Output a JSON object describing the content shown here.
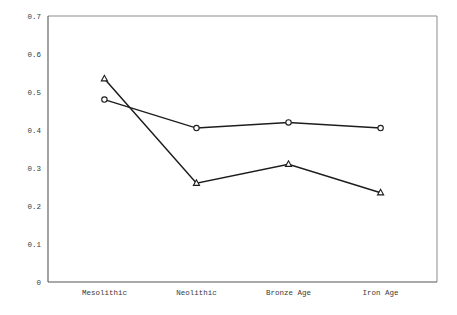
{
  "chart_data": {
    "type": "line",
    "title": "",
    "subtitle": "",
    "xlabel": "",
    "ylabel": "",
    "categories": [
      "Mesolithic",
      "Neolithic",
      "Bronze Age",
      "Iron Age"
    ],
    "yticks": [
      "0",
      "0.1",
      "0.2",
      "0.3",
      "0.4",
      "0.5",
      "0.6",
      "0.7"
    ],
    "ytick_values": [
      0,
      0.1,
      0.2,
      0.3,
      0.4,
      0.5,
      0.6,
      0.7
    ],
    "ylim": [
      0,
      0.7
    ],
    "grid": false,
    "legend_position": "none",
    "series": [
      {
        "name": "Series 1",
        "marker": "circle",
        "color": "#1d1d1d",
        "values": [
          0.48,
          0.405,
          0.42,
          0.405
        ]
      },
      {
        "name": "Series 2",
        "marker": "triangle",
        "color": "#1d1d1d",
        "values": [
          0.535,
          0.26,
          0.31,
          0.235
        ]
      }
    ],
    "annotations": []
  },
  "style": {
    "axis_color": "#555555",
    "frame_color": "#8d8d8d",
    "line_color": "#1d1d1d",
    "marker_fill": "#ffffff",
    "background": "#ffffff",
    "text_color": "#3a3a3a"
  }
}
